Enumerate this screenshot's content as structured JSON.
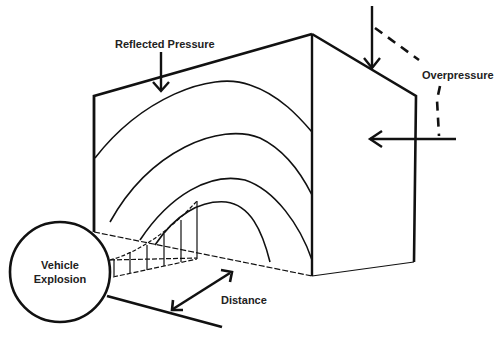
{
  "diagram": {
    "type": "blast-pressure-illustration",
    "labels": {
      "reflected_pressure": "Reflected Pressure",
      "overpressure": "Overpressure",
      "vehicle_explosion_line1": "Vehicle",
      "vehicle_explosion_line2": "Explosion",
      "distance": "Distance"
    },
    "colors": {
      "stroke": "#111111",
      "text": "#222222",
      "background": "#ffffff"
    }
  }
}
